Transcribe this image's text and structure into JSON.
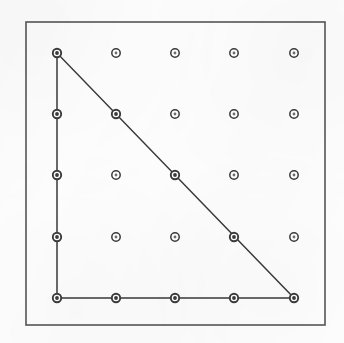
{
  "figure": {
    "kind": "geoboard-lattice-figure",
    "canvas": {
      "width": 344,
      "height": 343
    },
    "background_color": "#fdfdfd"
  },
  "frame": {
    "name": "outer-border",
    "x": 26,
    "y": 22,
    "width": 299,
    "height": 303,
    "stroke_color": "#555555",
    "stroke_width": 1.6,
    "fill": "none"
  },
  "grid": {
    "rows": 5,
    "columns": 5,
    "x_positions": [
      57,
      116,
      175,
      234,
      294
    ],
    "y_positions": [
      53,
      114,
      175,
      237,
      298
    ],
    "spacing_x": 59.25,
    "spacing_y": 61.25,
    "peg_outer_radius": 4.2,
    "peg_inner_radius": 1.9,
    "peg_stroke_color": "#3b3b3b",
    "peg_stroke_width": 1.5,
    "peg_fill_color": "#ffffff",
    "pegs": [
      {
        "label": "A1",
        "col": 1,
        "row": 1,
        "x": 57,
        "y": 53,
        "on_shape": true
      },
      {
        "label": "B1",
        "col": 2,
        "row": 1,
        "x": 116,
        "y": 53,
        "on_shape": false
      },
      {
        "label": "C1",
        "col": 3,
        "row": 1,
        "x": 175,
        "y": 53,
        "on_shape": false
      },
      {
        "label": "D1",
        "col": 4,
        "row": 1,
        "x": 234,
        "y": 53,
        "on_shape": false
      },
      {
        "label": "E1",
        "col": 5,
        "row": 1,
        "x": 294,
        "y": 53,
        "on_shape": false
      },
      {
        "label": "A2",
        "col": 1,
        "row": 2,
        "x": 57,
        "y": 114,
        "on_shape": true
      },
      {
        "label": "B2",
        "col": 2,
        "row": 2,
        "x": 116,
        "y": 114,
        "on_shape": true
      },
      {
        "label": "C2",
        "col": 3,
        "row": 2,
        "x": 175,
        "y": 114,
        "on_shape": false
      },
      {
        "label": "D2",
        "col": 4,
        "row": 2,
        "x": 234,
        "y": 114,
        "on_shape": false
      },
      {
        "label": "E2",
        "col": 5,
        "row": 2,
        "x": 294,
        "y": 114,
        "on_shape": false
      },
      {
        "label": "A3",
        "col": 1,
        "row": 3,
        "x": 57,
        "y": 175,
        "on_shape": true
      },
      {
        "label": "B3",
        "col": 2,
        "row": 3,
        "x": 116,
        "y": 175,
        "on_shape": false
      },
      {
        "label": "C3",
        "col": 3,
        "row": 3,
        "x": 175,
        "y": 175,
        "on_shape": true
      },
      {
        "label": "D3",
        "col": 4,
        "row": 3,
        "x": 234,
        "y": 175,
        "on_shape": false
      },
      {
        "label": "E3",
        "col": 5,
        "row": 3,
        "x": 294,
        "y": 175,
        "on_shape": false
      },
      {
        "label": "A4",
        "col": 1,
        "row": 4,
        "x": 57,
        "y": 237,
        "on_shape": true
      },
      {
        "label": "B4",
        "col": 2,
        "row": 4,
        "x": 116,
        "y": 237,
        "on_shape": false
      },
      {
        "label": "C4",
        "col": 3,
        "row": 4,
        "x": 175,
        "y": 237,
        "on_shape": false
      },
      {
        "label": "D4",
        "col": 4,
        "row": 4,
        "x": 234,
        "y": 237,
        "on_shape": true
      },
      {
        "label": "E4",
        "col": 5,
        "row": 4,
        "x": 294,
        "y": 237,
        "on_shape": false
      },
      {
        "label": "A5",
        "col": 1,
        "row": 5,
        "x": 57,
        "y": 298,
        "on_shape": true
      },
      {
        "label": "B5",
        "col": 2,
        "row": 5,
        "x": 116,
        "y": 298,
        "on_shape": true
      },
      {
        "label": "C5",
        "col": 3,
        "row": 5,
        "x": 175,
        "y": 298,
        "on_shape": true
      },
      {
        "label": "D5",
        "col": 4,
        "row": 5,
        "x": 234,
        "y": 298,
        "on_shape": true
      },
      {
        "label": "E5",
        "col": 5,
        "row": 5,
        "x": 294,
        "y": 298,
        "on_shape": true
      }
    ]
  },
  "shape": {
    "name": "right-triangle",
    "type": "polygon",
    "closed": true,
    "stroke_color": "#3a3a3a",
    "stroke_width": 1.5,
    "fill": "none",
    "points": "57,53 57,298 294,298",
    "vertices": [
      {
        "name": "apex-top-left",
        "x": 57,
        "y": 53,
        "peg": "A1"
      },
      {
        "name": "right-angle-corner",
        "x": 57,
        "y": 298,
        "peg": "A5"
      },
      {
        "name": "base-right",
        "x": 294,
        "y": 298,
        "peg": "E5"
      }
    ],
    "edges": [
      {
        "name": "vertical-leg",
        "from": "A1",
        "to": "A5",
        "x1": 57,
        "y1": 53,
        "x2": 57,
        "y2": 298
      },
      {
        "name": "horizontal-leg",
        "from": "A5",
        "to": "E5",
        "x1": 57,
        "y1": 298,
        "x2": 294,
        "y2": 298
      },
      {
        "name": "hypotenuse",
        "from": "E5",
        "to": "A1",
        "x1": 294,
        "y1": 298,
        "x2": 57,
        "y2": 53
      }
    ],
    "lattice_points_on_hypotenuse": [
      "B2",
      "C3",
      "D4"
    ],
    "lattice_points_on_vertical_leg": [
      "A2",
      "A3",
      "A4"
    ],
    "lattice_points_on_horizontal_leg": [
      "B5",
      "C5",
      "D5"
    ]
  }
}
